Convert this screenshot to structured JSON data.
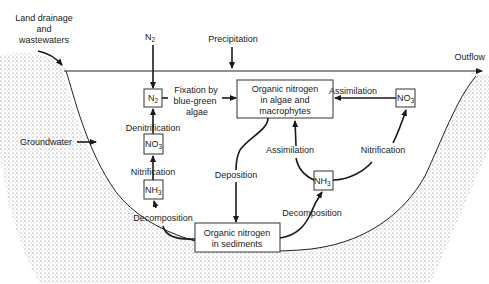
{
  "diagram": {
    "inputs": {
      "land_drainage": [
        "Land drainage",
        "and",
        "wastewaters"
      ],
      "n2_atmosphere": "N",
      "n2_atmosphere_sub": "2",
      "precipitation": "Precipitation",
      "groundwater": "Groundwater",
      "outflow": "Outflow"
    },
    "nodes": {
      "n2": {
        "label": "N",
        "sub": "2"
      },
      "no3_left": {
        "label": "NO",
        "sub": "3"
      },
      "nh3_left": {
        "label": "NH",
        "sub": "3"
      },
      "organic_algae": [
        "Organic nitrogen",
        "in algae and",
        "macrophytes"
      ],
      "organic_sediments": [
        "Organic nitrogen",
        "in sediments"
      ],
      "nh3_right": {
        "label": "NH",
        "sub": "3"
      },
      "no3_right": {
        "label": "NO",
        "sub": "3"
      }
    },
    "processes": {
      "fixation": [
        "Fixation by",
        "blue-green",
        "algae"
      ],
      "denitrification": "Denitrification",
      "nitrification_left": "Nitrification",
      "decomposition_left": "Decomposition",
      "deposition": "Deposition",
      "assimilation_top": "Assimilation",
      "assimilation_mid": "Assimilation",
      "nitrification_right": "Nitrification",
      "decomposition_right": "Decomposition"
    },
    "colors": {
      "line": "#1a1a1a",
      "sediment_dots": "#555555",
      "background": "#ffffff"
    }
  }
}
